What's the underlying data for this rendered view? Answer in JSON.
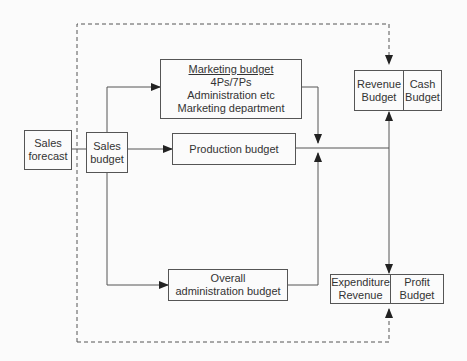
{
  "diagram": {
    "sales_forecast": {
      "lines": [
        "Sales",
        "forecast"
      ]
    },
    "sales_budget": {
      "lines": [
        "Sales",
        "budget"
      ]
    },
    "marketing_budget": {
      "title": "Marketing budget",
      "lines": [
        "4Ps/7Ps",
        "Administration etc",
        "Marketing department"
      ]
    },
    "production_budget": {
      "label": "Production budget"
    },
    "admin_budget": {
      "lines": [
        "Overall",
        "administration budget"
      ]
    },
    "revenue_budget": {
      "lines": [
        "Revenue",
        "Budget"
      ]
    },
    "cash_budget": {
      "lines": [
        "Cash",
        "Budget"
      ]
    },
    "expenditure_revenue": {
      "lines": [
        "Expenditure",
        "Revenue"
      ]
    },
    "profit_budget": {
      "lines": [
        "Profit",
        "Budget"
      ]
    },
    "colors": {
      "stroke": "#555555",
      "text": "#333333",
      "background": "#fbfbfb"
    }
  }
}
